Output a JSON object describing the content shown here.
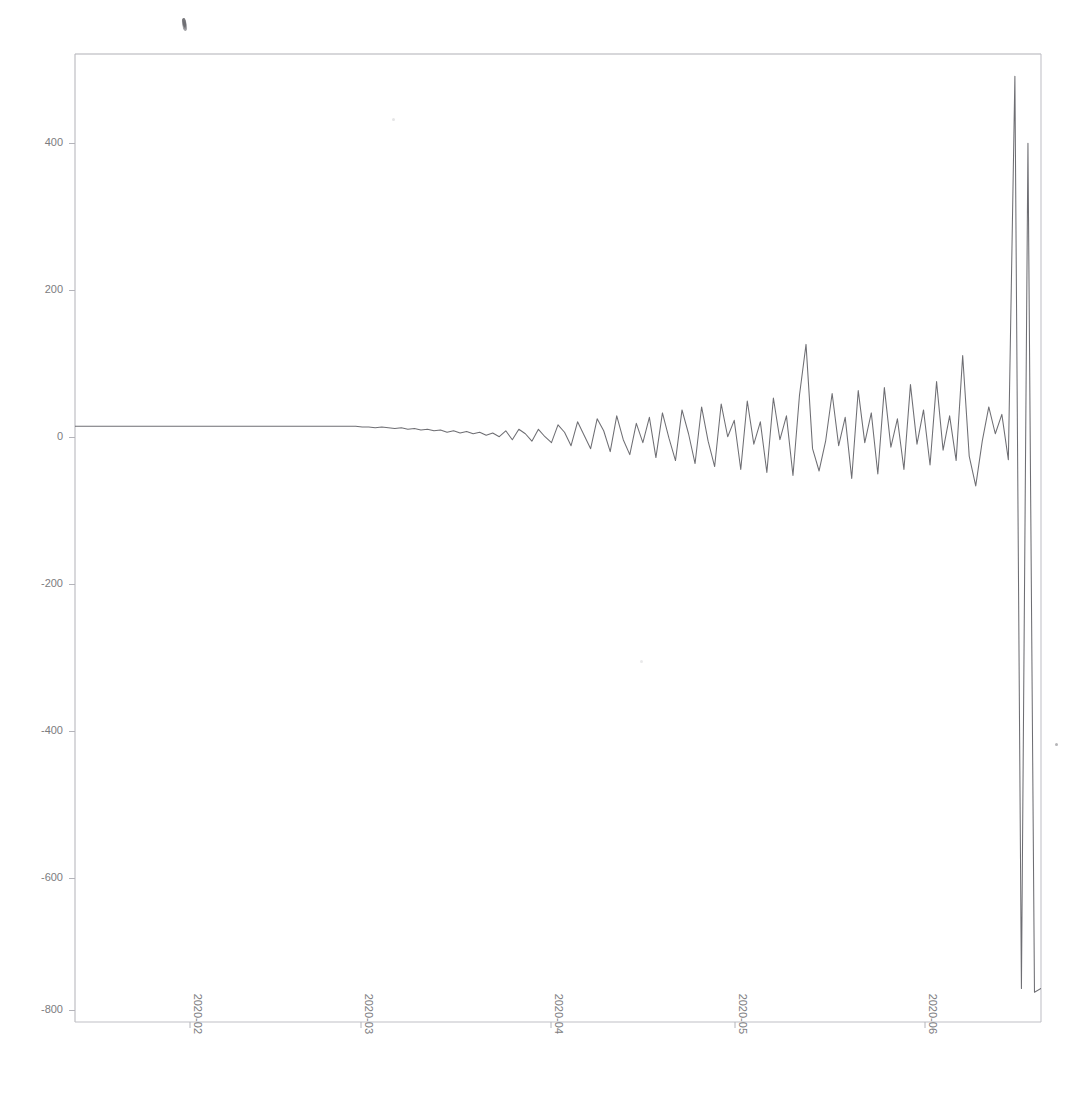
{
  "figure": {
    "title": "",
    "background_color": "#ffffff",
    "line_color": "#5a5a60",
    "axis_color": "#b4b4ba",
    "tick_label_color": "#7c7c80",
    "width_px": 1085,
    "height_px": 1101
  },
  "plot_area": {
    "left_px": 75,
    "top_px": 54,
    "right_px": 1041,
    "bottom_px": 1022
  },
  "artifacts": {
    "smudge_label": "scan-smudge",
    "speck_label": "scan-speck"
  },
  "chart_data": {
    "type": "line",
    "title": "",
    "xlabel": "",
    "ylabel": "",
    "grid": false,
    "legend": false,
    "legend_position": "none",
    "ylim": [
      -800,
      500
    ],
    "yticks": [
      400,
      200,
      0,
      -200,
      -400,
      -600,
      -800
    ],
    "ytick_labels": [
      "400",
      "200",
      "0",
      "-200",
      "-400",
      "-600",
      "-800"
    ],
    "xlim": [
      "2020-01-18",
      "2020-06-14"
    ],
    "xticks": [
      "2020-02",
      "2020-03",
      "2020-04",
      "2020-05",
      "2020-06"
    ],
    "xtick_labels": [
      "2020-02",
      "2020-03",
      "2020-04",
      "2020-05",
      "2020-06"
    ],
    "xtick_rotation_deg": 90,
    "series": [
      {
        "name": "value",
        "x": [
          "2020-01-18",
          "2020-01-19",
          "2020-01-20",
          "2020-01-21",
          "2020-01-22",
          "2020-01-23",
          "2020-01-24",
          "2020-01-25",
          "2020-01-26",
          "2020-01-27",
          "2020-01-28",
          "2020-01-29",
          "2020-01-30",
          "2020-01-31",
          "2020-02-01",
          "2020-02-02",
          "2020-02-03",
          "2020-02-04",
          "2020-02-05",
          "2020-02-06",
          "2020-02-07",
          "2020-02-08",
          "2020-02-09",
          "2020-02-10",
          "2020-02-11",
          "2020-02-12",
          "2020-02-13",
          "2020-02-14",
          "2020-02-15",
          "2020-02-16",
          "2020-02-17",
          "2020-02-18",
          "2020-02-19",
          "2020-02-20",
          "2020-02-21",
          "2020-02-22",
          "2020-02-23",
          "2020-02-24",
          "2020-02-25",
          "2020-02-26",
          "2020-02-27",
          "2020-02-28",
          "2020-02-29",
          "2020-03-01",
          "2020-03-02",
          "2020-03-03",
          "2020-03-04",
          "2020-03-05",
          "2020-03-06",
          "2020-03-07",
          "2020-03-08",
          "2020-03-09",
          "2020-03-10",
          "2020-03-11",
          "2020-03-12",
          "2020-03-13",
          "2020-03-14",
          "2020-03-15",
          "2020-03-16",
          "2020-03-17",
          "2020-03-18",
          "2020-03-19",
          "2020-03-20",
          "2020-03-21",
          "2020-03-22",
          "2020-03-23",
          "2020-03-24",
          "2020-03-25",
          "2020-03-26",
          "2020-03-27",
          "2020-03-28",
          "2020-03-29",
          "2020-03-30",
          "2020-03-31",
          "2020-04-01",
          "2020-04-02",
          "2020-04-03",
          "2020-04-04",
          "2020-04-05",
          "2020-04-06",
          "2020-04-07",
          "2020-04-08",
          "2020-04-09",
          "2020-04-10",
          "2020-04-11",
          "2020-04-12",
          "2020-04-13",
          "2020-04-14",
          "2020-04-15",
          "2020-04-16",
          "2020-04-17",
          "2020-04-18",
          "2020-04-19",
          "2020-04-20",
          "2020-04-21",
          "2020-04-22",
          "2020-04-23",
          "2020-04-24",
          "2020-04-25",
          "2020-04-26",
          "2020-04-27",
          "2020-04-28",
          "2020-04-29",
          "2020-04-30",
          "2020-05-01",
          "2020-05-02",
          "2020-05-03",
          "2020-05-04",
          "2020-05-05",
          "2020-05-06",
          "2020-05-07",
          "2020-05-08",
          "2020-05-09",
          "2020-05-10",
          "2020-05-11",
          "2020-05-12",
          "2020-05-13",
          "2020-05-14",
          "2020-05-15",
          "2020-05-16",
          "2020-05-17",
          "2020-05-18",
          "2020-05-19",
          "2020-05-20",
          "2020-05-21",
          "2020-05-22",
          "2020-05-23",
          "2020-05-24",
          "2020-05-25",
          "2020-05-26",
          "2020-05-27",
          "2020-05-28",
          "2020-05-29",
          "2020-05-30",
          "2020-05-31",
          "2020-06-01",
          "2020-06-02",
          "2020-06-03",
          "2020-06-04",
          "2020-06-05",
          "2020-06-06",
          "2020-06-07",
          "2020-06-08",
          "2020-06-09",
          "2020-06-10",
          "2020-06-11",
          "2020-06-12",
          "2020-06-13",
          "2020-06-14"
        ],
        "values": [
          0,
          0,
          0,
          0,
          0,
          0,
          0,
          0,
          0,
          0,
          0,
          0,
          0,
          0,
          0,
          0,
          0,
          0,
          0,
          0,
          0,
          0,
          0,
          0,
          0,
          0,
          0,
          0,
          0,
          0,
          0,
          0,
          0,
          0,
          0,
          0,
          0,
          0,
          0,
          0,
          0,
          0,
          0,
          0,
          -1,
          -1,
          -2,
          -1,
          -2,
          -3,
          -2,
          -4,
          -3,
          -5,
          -4,
          -6,
          -5,
          -8,
          -6,
          -9,
          -7,
          -10,
          -8,
          -12,
          -9,
          -14,
          -6,
          -18,
          -4,
          -10,
          -20,
          -4,
          -14,
          -22,
          2,
          -8,
          -26,
          6,
          -12,
          -30,
          10,
          -6,
          -34,
          14,
          -18,
          -38,
          4,
          -22,
          12,
          -42,
          18,
          -16,
          -46,
          22,
          -10,
          -50,
          26,
          -20,
          -54,
          30,
          -14,
          8,
          -58,
          34,
          -24,
          6,
          -62,
          38,
          -18,
          14,
          -66,
          42,
          110,
          -30,
          -60,
          -20,
          44,
          -26,
          12,
          -70,
          48,
          -22,
          18,
          -64,
          52,
          -28,
          10,
          -58,
          56,
          -24,
          22,
          -52,
          60,
          -32,
          14,
          -46,
          95,
          -40,
          -80,
          -20,
          26,
          -10,
          16,
          -45,
          470,
          -755,
          380,
          -760,
          -755
        ]
      }
    ],
    "annotations": []
  }
}
